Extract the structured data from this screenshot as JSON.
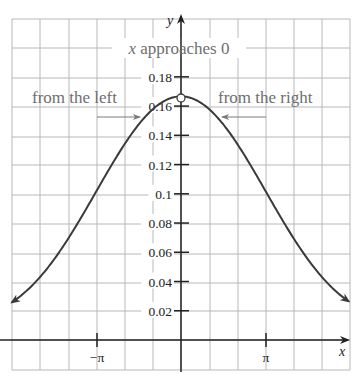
{
  "chart_data": {
    "type": "line",
    "title": "",
    "function": "(x - sin x) / x^3",
    "xlabel": "x",
    "ylabel": "y",
    "x_ticks": [
      {
        "label": "−π",
        "value": -3.14159
      },
      {
        "label": "π",
        "value": 3.14159
      }
    ],
    "y_ticks": [
      {
        "label": "0.02",
        "value": 0.02
      },
      {
        "label": "0.04",
        "value": 0.04
      },
      {
        "label": "0.06",
        "value": 0.06
      },
      {
        "label": "0.08",
        "value": 0.08
      },
      {
        "label": "0.1",
        "value": 0.1
      },
      {
        "label": "0.12",
        "value": 0.12
      },
      {
        "label": "0.14",
        "value": 0.14
      },
      {
        "label": "0.16",
        "value": 0.16
      },
      {
        "label": "0.18",
        "value": 0.18
      }
    ],
    "xlim": [
      -6.25,
      6.2
    ],
    "ylim": [
      0,
      0.19
    ],
    "grid": true,
    "series": [
      {
        "name": "f(x)",
        "x": [
          -6.25,
          -5,
          -4,
          -3.14159,
          -2,
          -1,
          0,
          1,
          2,
          3.14159,
          4,
          5,
          6.25
        ],
        "y": [
          0.0257,
          0.0323,
          0.0507,
          0.1013,
          0.1363,
          0.1585,
          0.1667,
          0.1585,
          0.1363,
          0.1013,
          0.0507,
          0.0323,
          0.0257
        ]
      }
    ],
    "open_point": {
      "x": 0,
      "y": 0.1667
    },
    "annotations": [
      {
        "text": "x approaches 0"
      },
      {
        "text": "from the left",
        "arrow": "right"
      },
      {
        "text": "from the right",
        "arrow": "left"
      }
    ]
  },
  "labels": {
    "x_axis": "x",
    "y_axis": "y",
    "approach_x": "x",
    "approach_rest": " approaches 0",
    "from_left": "from the left",
    "from_right": "from the right",
    "neg_pi": "−π",
    "pos_pi": "π"
  }
}
